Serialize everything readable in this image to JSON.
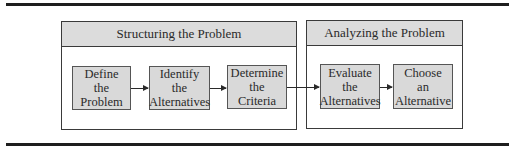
{
  "diagram": {
    "groups": [
      {
        "title": "Structuring the Problem",
        "steps": [
          {
            "lines": [
              "Define",
              "the",
              "Problem"
            ]
          },
          {
            "lines": [
              "Identify",
              "the",
              "Alternatives"
            ]
          },
          {
            "lines": [
              "Determine",
              "the",
              "Criteria"
            ]
          }
        ]
      },
      {
        "title": "Analyzing the Problem",
        "steps": [
          {
            "lines": [
              "Evaluate",
              "the",
              "Alternatives"
            ]
          },
          {
            "lines": [
              "Choose",
              "an",
              "Alternative"
            ]
          }
        ]
      }
    ],
    "flow": [
      "Define the Problem",
      "Identify the Alternatives",
      "Determine the Criteria",
      "Evaluate the Alternatives",
      "Choose an Alternative"
    ],
    "colors": {
      "header_fill": "#dcdcdc",
      "step_fill": "#d9d9d9",
      "border": "#3a3a3a",
      "rule": "#1e1e1e"
    }
  }
}
